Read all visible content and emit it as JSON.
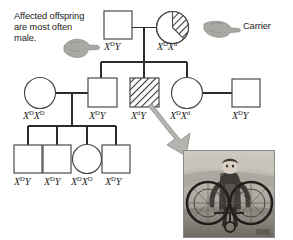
{
  "diagram": {
    "type": "pedigree-chart",
    "annotations": {
      "affected_note": "Affected offspring are most often male.",
      "carrier_label": "Carrier"
    },
    "symbols": {
      "male": "square",
      "female": "circle",
      "affected_fill": "full-diagonal-hatch",
      "carrier_fill": "half-diagonal-hatch"
    },
    "colors": {
      "line": "#2b2b2b",
      "hatch": "#3a3a3a",
      "text": "#1c1c1c",
      "hand": "#9a9a96",
      "arrow": "#a8a8a4",
      "symbol_fill": "#ffffff"
    },
    "generations": [
      {
        "id": "I",
        "individuals": [
          {
            "id": "I-1",
            "sex": "male",
            "status": "unaffected",
            "genotype_x": "X",
            "genotype_sup1": "D",
            "genotype_tail": "Y",
            "genotype_plain": "X(D)Y"
          },
          {
            "id": "I-2",
            "sex": "female",
            "status": "carrier",
            "genotype_x": "X",
            "genotype_sup1": "D",
            "genotype_x2": "X",
            "genotype_sup2": "d",
            "genotype_plain": "X(D)X(d)"
          }
        ]
      },
      {
        "id": "II",
        "individuals": [
          {
            "id": "II-1",
            "sex": "female",
            "status": "unaffected",
            "genotype_x": "X",
            "genotype_sup1": "D",
            "genotype_x2": "X",
            "genotype_sup2": "D",
            "genotype_plain": "X(D)X(D)"
          },
          {
            "id": "II-2",
            "sex": "male",
            "status": "unaffected",
            "genotype_x": "X",
            "genotype_sup1": "D",
            "genotype_tail": "Y",
            "genotype_plain": "X(D)Y"
          },
          {
            "id": "II-3",
            "sex": "male",
            "status": "affected",
            "genotype_x": "X",
            "genotype_sup1": "d",
            "genotype_tail": "Y",
            "genotype_plain": "X(d)Y"
          },
          {
            "id": "II-4",
            "sex": "female",
            "status": "carrier-genotype",
            "genotype_x": "X",
            "genotype_sup1": "D",
            "genotype_x2": "X",
            "genotype_sup2": "d",
            "genotype_plain": "X(D)X(d)"
          },
          {
            "id": "II-5",
            "sex": "male",
            "status": "unaffected",
            "genotype_x": "X",
            "genotype_sup1": "D",
            "genotype_tail": "Y",
            "genotype_plain": "X(D)Y"
          }
        ]
      },
      {
        "id": "III",
        "individuals": [
          {
            "id": "III-1",
            "sex": "male",
            "status": "unaffected",
            "genotype_x": "X",
            "genotype_sup1": "D",
            "genotype_tail": "Y",
            "genotype_plain": "X(D)Y"
          },
          {
            "id": "III-2",
            "sex": "male",
            "status": "unaffected",
            "genotype_x": "X",
            "genotype_sup1": "D",
            "genotype_tail": "Y",
            "genotype_plain": "X(D)Y"
          },
          {
            "id": "III-3",
            "sex": "female",
            "status": "unaffected",
            "genotype_x": "X",
            "genotype_sup1": "D",
            "genotype_x2": "X",
            "genotype_sup2": "D",
            "genotype_plain": "X(D)X(D)"
          },
          {
            "id": "III-4",
            "sex": "male",
            "status": "unaffected",
            "genotype_x": "X",
            "genotype_sup1": "D",
            "genotype_tail": "Y",
            "genotype_plain": "X(D)Y"
          }
        ]
      }
    ],
    "photo": {
      "caption": "",
      "description": "black-and-white photograph of a boy seated in a wheelchair"
    }
  }
}
